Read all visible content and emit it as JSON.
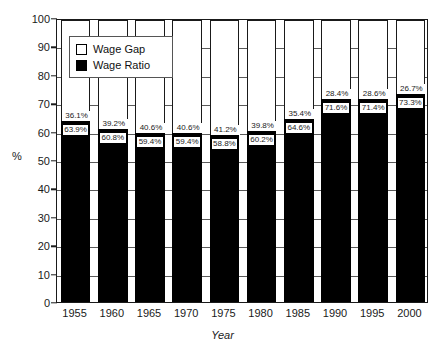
{
  "chart_data": {
    "type": "bar",
    "stacked": true,
    "title": "",
    "xlabel": "Year",
    "ylabel": "%",
    "ylim": [
      0,
      100
    ],
    "ytick_step": 10,
    "grid": true,
    "legend_position": "top-left-inside",
    "categories": [
      "1955",
      "1960",
      "1965",
      "1970",
      "1975",
      "1980",
      "1985",
      "1990",
      "1995",
      "2000"
    ],
    "series": [
      {
        "name": "Wage Ratio",
        "color": "#000000",
        "values": [
          63.9,
          60.8,
          59.4,
          59.4,
          58.8,
          60.2,
          64.6,
          71.6,
          71.4,
          73.3
        ],
        "labels": [
          "63.9%",
          "60.8%",
          "59.4%",
          "59.4%",
          "58.8%",
          "60.2%",
          "64.6%",
          "71.6%",
          "71.4%",
          "73.3%"
        ]
      },
      {
        "name": "Wage Gap",
        "color": "#ffffff",
        "values": [
          36.1,
          39.2,
          40.6,
          40.6,
          41.2,
          39.8,
          35.4,
          28.4,
          28.6,
          26.7
        ],
        "labels": [
          "36.1%",
          "39.2%",
          "40.6%",
          "40.6%",
          "41.2%",
          "39.8%",
          "35.4%",
          "28.4%",
          "28.6%",
          "26.7%"
        ]
      }
    ],
    "ytick_labels": [
      "0",
      "10",
      "20",
      "30",
      "40",
      "50",
      "60",
      "70",
      "80",
      "90",
      "100"
    ]
  },
  "legend": {
    "items": [
      {
        "label": "Wage Gap",
        "swatch": "white"
      },
      {
        "label": "Wage Ratio",
        "swatch": "black"
      }
    ]
  },
  "axes": {
    "y_title": "%",
    "x_title": "Year"
  }
}
